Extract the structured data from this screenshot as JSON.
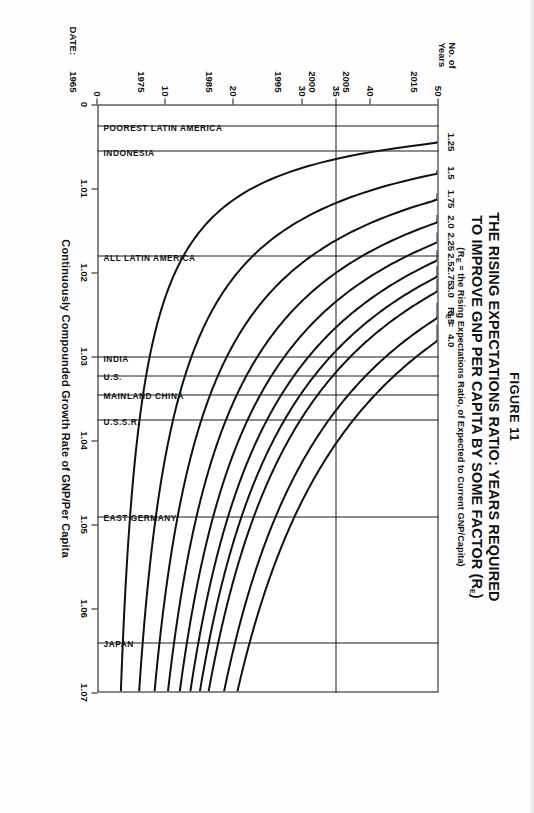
{
  "figure": {
    "number": "FIGURE 11",
    "title_line1": "THE RISING EXPECTATIONS RATIO: YEARS REQUIRED",
    "title_line2": "TO IMPROVE GNP PER CAPITA BY SOME FACTOR (R",
    "title_line2_sub": "E",
    "title_line2_end": ")",
    "subtitle_pre": "(R",
    "subtitle_sub": "E",
    "subtitle_post": " = the Rising Expectations Ratio, of Expected to Current GNP/Capita)"
  },
  "axes": {
    "x_title": "Continuously Compounded Growth Rate of GNP/Per Capita",
    "x_ticks": [
      "0",
      "1.01",
      "1.02",
      "1.03",
      "1.04",
      "1.05",
      "1.06",
      "1.07"
    ],
    "x_values": [
      0,
      1.01,
      1.02,
      1.03,
      1.04,
      1.05,
      1.06,
      1.07
    ],
    "y_title_line1": "No. of",
    "y_title_line2": "Years",
    "y_ticks": [
      "0",
      "10",
      "20",
      "30",
      "35",
      "40",
      "50"
    ],
    "y_values": [
      0,
      10,
      20,
      30,
      35,
      40,
      50
    ],
    "date_axis_label": "DATE:",
    "date_ticks": [
      "1965",
      "1975",
      "1985",
      "1995",
      "2000",
      "2005",
      "2015"
    ],
    "date_values": [
      0,
      10,
      20,
      30,
      35,
      40,
      50
    ]
  },
  "legend": {
    "header_pre": "R",
    "header_sub": "E",
    "header_post": " =",
    "labels": [
      "4.0",
      "3.5",
      "3.0",
      "2.75",
      "2.5",
      "2.25",
      "2.0",
      "1.75",
      "1.5",
      "1.25"
    ]
  },
  "countries": [
    {
      "name": "POOREST LATIN AMERICA",
      "rate": 1.0025
    },
    {
      "name": "INDONESIA",
      "rate": 1.0055
    },
    {
      "name": "ALL LATIN AMERICA",
      "rate": 1.018
    },
    {
      "name": "INDIA",
      "rate": 1.03
    },
    {
      "name": "U.S.",
      "rate": 1.0322
    },
    {
      "name": "MAINLAND CHINA",
      "rate": 1.0345
    },
    {
      "name": "U.S.S.R.",
      "rate": 1.0375
    },
    {
      "name": "EAST GERMANY",
      "rate": 1.049
    },
    {
      "name": "JAPAN",
      "rate": 1.064
    }
  ],
  "chart_data": {
    "type": "line",
    "subtitle": "(R_E = the Rising Expectations Ratio, of Expected to Current GNP/Capita)",
    "xlabel": "Continuously Compounded Growth Rate of GNP/Per Capita",
    "ylabel": "No. of Years",
    "xlim": [
      1.0,
      1.07
    ],
    "ylim": [
      0,
      50
    ],
    "x_tick_labels": [
      "0",
      "1.01",
      "1.02",
      "1.03",
      "1.04",
      "1.05",
      "1.06",
      "1.07"
    ],
    "y_tick_labels": [
      "0",
      "10",
      "20",
      "30",
      "35",
      "40",
      "50"
    ],
    "secondary_y_axis": {
      "name": "DATE:",
      "tick_labels": [
        "1965",
        "1975",
        "1985",
        "1995",
        "2000",
        "2005",
        "2015"
      ]
    },
    "grid": "vertical reference lines at country growth rates; horizontal line at 35 years",
    "legend_position": "top-right, labelled R_E =",
    "relation": "years = ln(R_E) / ln(growth_rate)",
    "series": [
      {
        "name": "4.0",
        "re": 4.0,
        "x": [
          1.029,
          1.031,
          1.034,
          1.038,
          1.042,
          1.047,
          1.053,
          1.06,
          1.07
        ],
        "y": [
          48.4,
          45.3,
          41.4,
          37.2,
          33.7,
          30.2,
          26.8,
          23.8,
          20.5
        ]
      },
      {
        "name": "3.5",
        "re": 3.5,
        "x": [
          1.026,
          1.029,
          1.032,
          1.036,
          1.041,
          1.046,
          1.052,
          1.06,
          1.07
        ],
        "y": [
          48.8,
          43.8,
          39.7,
          35.4,
          31.2,
          27.9,
          24.7,
          21.5,
          18.5
        ]
      },
      {
        "name": "3.0",
        "re": 3.0,
        "x": [
          1.0225,
          1.026,
          1.03,
          1.034,
          1.039,
          1.045,
          1.052,
          1.06,
          1.07
        ],
        "y": [
          49.3,
          42.8,
          37.2,
          32.8,
          28.7,
          24.9,
          21.6,
          18.8,
          16.2
        ]
      },
      {
        "name": "2.75",
        "re": 2.75,
        "x": [
          1.0207,
          1.024,
          1.028,
          1.033,
          1.039,
          1.045,
          1.052,
          1.06,
          1.07
        ],
        "y": [
          49.4,
          42.7,
          36.6,
          31.1,
          26.4,
          23.0,
          19.9,
          17.4,
          14.9
        ]
      },
      {
        "name": "2.5",
        "re": 2.5,
        "x": [
          1.0188,
          1.022,
          1.026,
          1.031,
          1.037,
          1.044,
          1.052,
          1.06,
          1.07
        ],
        "y": [
          49.2,
          42.1,
          35.7,
          29.9,
          25.2,
          21.3,
          18.1,
          15.7,
          13.5
        ]
      },
      {
        "name": "2.25",
        "re": 2.25,
        "x": [
          1.0165,
          1.02,
          1.0245,
          1.03,
          1.036,
          1.043,
          1.052,
          1.06,
          1.07
        ],
        "y": [
          49.5,
          40.9,
          33.5,
          27.4,
          23.0,
          19.3,
          16.0,
          13.9,
          12.0
        ]
      },
      {
        "name": "2.0",
        "re": 2.0,
        "x": [
          1.014,
          1.0175,
          1.022,
          1.028,
          1.035,
          1.043,
          1.052,
          1.06,
          1.07
        ],
        "y": [
          49.8,
          40.0,
          31.9,
          25.1,
          20.1,
          16.5,
          13.7,
          11.9,
          10.2
        ]
      },
      {
        "name": "1.75",
        "re": 1.75,
        "x": [
          1.0113,
          1.015,
          1.02,
          1.026,
          1.034,
          1.043,
          1.052,
          1.06,
          1.07
        ],
        "y": [
          49.8,
          37.6,
          28.3,
          21.8,
          16.7,
          13.3,
          11.1,
          9.6,
          8.3
        ]
      },
      {
        "name": "1.5",
        "re": 1.5,
        "x": [
          1.0082,
          1.012,
          1.017,
          1.024,
          1.033,
          1.043,
          1.052,
          1.06,
          1.07
        ],
        "y": [
          49.6,
          34.0,
          24.1,
          17.1,
          12.5,
          9.6,
          8.0,
          7.0,
          6.0
        ]
      },
      {
        "name": "1.25",
        "re": 1.25,
        "x": [
          1.0045,
          1.008,
          1.013,
          1.02,
          1.03,
          1.042,
          1.052,
          1.06,
          1.07
        ],
        "y": [
          49.7,
          28.0,
          17.3,
          11.3,
          7.5,
          5.4,
          4.4,
          3.8,
          3.2
        ]
      }
    ],
    "annotations": [
      {
        "label": "POOREST LATIN AMERICA",
        "x": 1.0025
      },
      {
        "label": "INDONESIA",
        "x": 1.0055
      },
      {
        "label": "ALL LATIN AMERICA",
        "x": 1.018
      },
      {
        "label": "INDIA",
        "x": 1.03
      },
      {
        "label": "U.S.",
        "x": 1.0322
      },
      {
        "label": "MAINLAND CHINA",
        "x": 1.0345
      },
      {
        "label": "U.S.S.R.",
        "x": 1.0375
      },
      {
        "label": "EAST GERMANY",
        "x": 1.049
      },
      {
        "label": "JAPAN",
        "x": 1.064
      }
    ]
  }
}
